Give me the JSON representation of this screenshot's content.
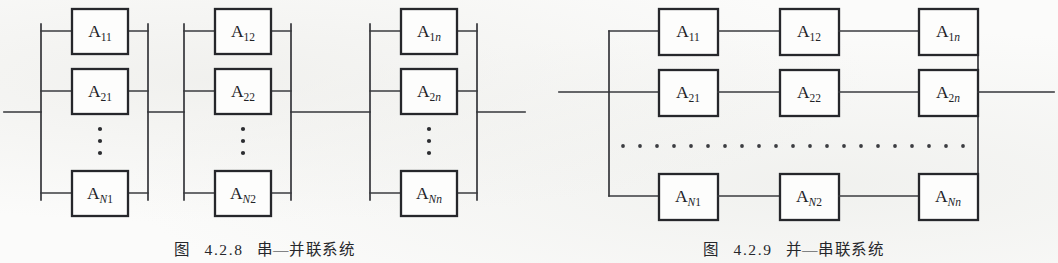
{
  "figures": [
    {
      "id": "series-parallel",
      "caption_prefix": "图",
      "caption_number": "4.2.8",
      "caption_title": "串—并联系统",
      "caption_full": "图 4.2.8 串—并联系统",
      "type": "series-parallel-reliability-block-diagram",
      "groups": [
        {
          "index": 1,
          "boxes": [
            {
              "label": "A",
              "sub": "11",
              "sub_plain": "11",
              "sub_italic": "",
              "full": "A11"
            },
            {
              "label": "A",
              "sub": "21",
              "sub_plain": "21",
              "sub_italic": "",
              "full": "A21"
            },
            {
              "label": "A",
              "sub": "N1",
              "sub_plain": "1",
              "sub_italic": "N",
              "full": "AN1"
            }
          ],
          "ellipsis": "vertical"
        },
        {
          "index": 2,
          "boxes": [
            {
              "label": "A",
              "sub": "12",
              "sub_plain": "12",
              "sub_italic": "",
              "full": "A12"
            },
            {
              "label": "A",
              "sub": "22",
              "sub_plain": "22",
              "sub_italic": "",
              "full": "A22"
            },
            {
              "label": "A",
              "sub": "N2",
              "sub_plain": "2",
              "sub_italic": "N",
              "full": "AN2"
            }
          ],
          "ellipsis": "vertical"
        },
        {
          "index": 3,
          "boxes": [
            {
              "label": "A",
              "sub": "1n",
              "sub_plain": "1",
              "sub_italic": "n",
              "full": "A1n"
            },
            {
              "label": "A",
              "sub": "2n",
              "sub_plain": "2",
              "sub_italic": "n",
              "full": "A2n"
            },
            {
              "label": "A",
              "sub": "Nn",
              "sub_plain": "",
              "sub_italic": "Nn",
              "full": "ANn"
            }
          ],
          "ellipsis": "vertical"
        }
      ]
    },
    {
      "id": "parallel-series",
      "caption_prefix": "图",
      "caption_number": "4.2.9",
      "caption_title": "并—串联系统",
      "caption_full": "图 4.2.9 并—串联系统",
      "type": "parallel-series-reliability-block-diagram",
      "rows": [
        {
          "index": 1,
          "boxes": [
            {
              "label": "A",
              "sub": "11",
              "sub_plain": "11",
              "sub_italic": "",
              "full": "A11"
            },
            {
              "label": "A",
              "sub": "12",
              "sub_plain": "12",
              "sub_italic": "",
              "full": "A12"
            },
            {
              "label": "A",
              "sub": "1n",
              "sub_plain": "1",
              "sub_italic": "n",
              "full": "A1n"
            }
          ]
        },
        {
          "index": 2,
          "boxes": [
            {
              "label": "A",
              "sub": "21",
              "sub_plain": "21",
              "sub_italic": "",
              "full": "A21"
            },
            {
              "label": "A",
              "sub": "22",
              "sub_plain": "22",
              "sub_italic": "",
              "full": "A22"
            },
            {
              "label": "A",
              "sub": "2n",
              "sub_plain": "2",
              "sub_italic": "n",
              "full": "A2n"
            }
          ]
        },
        {
          "index": 3,
          "boxes": [
            {
              "label": "A",
              "sub": "N1",
              "sub_plain": "1",
              "sub_italic": "N",
              "full": "AN1"
            },
            {
              "label": "A",
              "sub": "N2",
              "sub_plain": "2",
              "sub_italic": "N",
              "full": "AN2"
            },
            {
              "label": "A",
              "sub": "Nn",
              "sub_plain": "",
              "sub_italic": "Nn",
              "full": "ANn"
            }
          ]
        }
      ],
      "ellipsis": "horizontal-dotted"
    }
  ],
  "colors": {
    "background": "#fbfbfa",
    "line": "#35363a",
    "box_stroke": "#26272b",
    "box_fill": "#fdfdfc",
    "text": "#222327"
  }
}
